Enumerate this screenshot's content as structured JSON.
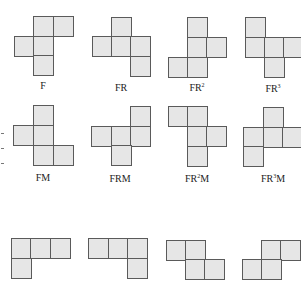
{
  "figure": {
    "cell_size": 19.5,
    "fill_color": "#e6e6e6",
    "border_color": "#5a5a5a",
    "shapes": [
      {
        "id": "F",
        "label_base": "F",
        "label_sup": "",
        "label_tail": "",
        "label_x": 43,
        "label_y": 81,
        "squares": [
          [
            33,
            16
          ],
          [
            53,
            16
          ],
          [
            14,
            36
          ],
          [
            33,
            36
          ],
          [
            33,
            55
          ]
        ]
      },
      {
        "id": "FR",
        "label_base": "FR",
        "label_sup": "",
        "label_tail": "",
        "label_x": 121,
        "label_y": 83,
        "squares": [
          [
            111,
            17
          ],
          [
            92,
            36
          ],
          [
            111,
            36
          ],
          [
            130,
            36
          ],
          [
            130,
            56
          ]
        ]
      },
      {
        "id": "FR2",
        "label_base": "FR",
        "label_sup": "2",
        "label_tail": "",
        "label_x": 197,
        "label_y": 83,
        "squares": [
          [
            187,
            17
          ],
          [
            187,
            37
          ],
          [
            206,
            37
          ],
          [
            168,
            57
          ],
          [
            187,
            57
          ]
        ]
      },
      {
        "id": "FR3",
        "label_base": "FR",
        "label_sup": "3",
        "label_tail": "",
        "label_x": 273,
        "label_y": 84,
        "squares": [
          [
            245,
            17
          ],
          [
            245,
            37
          ],
          [
            264,
            37
          ],
          [
            283,
            37
          ],
          [
            264,
            57
          ]
        ]
      },
      {
        "id": "FM",
        "label_base": "FM",
        "label_sup": "",
        "label_tail": "",
        "label_x": 43,
        "label_y": 173,
        "squares": [
          [
            33,
            105
          ],
          [
            13,
            125
          ],
          [
            33,
            125
          ],
          [
            33,
            145
          ],
          [
            53,
            145
          ]
        ]
      },
      {
        "id": "FRM",
        "label_base": "FRM",
        "label_sup": "",
        "label_tail": "",
        "label_x": 120,
        "label_y": 174,
        "squares": [
          [
            130,
            106
          ],
          [
            91,
            126
          ],
          [
            111,
            126
          ],
          [
            130,
            126
          ],
          [
            111,
            145
          ]
        ]
      },
      {
        "id": "FR2M",
        "label_base": "FR",
        "label_sup": "2",
        "label_tail": "M",
        "label_x": 197,
        "label_y": 174,
        "squares": [
          [
            168,
            106
          ],
          [
            187,
            106
          ],
          [
            187,
            126
          ],
          [
            206,
            126
          ],
          [
            187,
            146
          ]
        ]
      },
      {
        "id": "FR3M",
        "label_base": "FR",
        "label_sup": "3",
        "label_tail": "M",
        "label_x": 273,
        "label_y": 174,
        "squares": [
          [
            263,
            107
          ],
          [
            243,
            127
          ],
          [
            263,
            127
          ],
          [
            282,
            127
          ],
          [
            243,
            146
          ]
        ]
      },
      {
        "id": "row3-1",
        "label_base": "",
        "label_sup": "",
        "label_tail": "",
        "label_x": 40,
        "label_y": 0,
        "squares": [
          [
            11,
            238
          ],
          [
            30,
            238
          ],
          [
            50,
            238
          ],
          [
            11,
            258
          ]
        ]
      },
      {
        "id": "row3-2",
        "label_base": "",
        "label_sup": "",
        "label_tail": "",
        "label_x": 117,
        "label_y": 0,
        "squares": [
          [
            88,
            238
          ],
          [
            108,
            238
          ],
          [
            127,
            238
          ],
          [
            127,
            258
          ]
        ]
      },
      {
        "id": "row3-3",
        "label_base": "",
        "label_sup": "",
        "label_tail": "",
        "label_x": 194,
        "label_y": 0,
        "squares": [
          [
            166,
            240
          ],
          [
            185,
            240
          ],
          [
            185,
            259
          ],
          [
            204,
            259
          ]
        ]
      },
      {
        "id": "row3-4",
        "label_base": "",
        "label_sup": "",
        "label_tail": "",
        "label_x": 270,
        "label_y": 0,
        "squares": [
          [
            261,
            240
          ],
          [
            280,
            240
          ],
          [
            242,
            259
          ],
          [
            261,
            259
          ]
        ]
      }
    ],
    "edge_marks_y": [
      133,
      148,
      163
    ]
  }
}
